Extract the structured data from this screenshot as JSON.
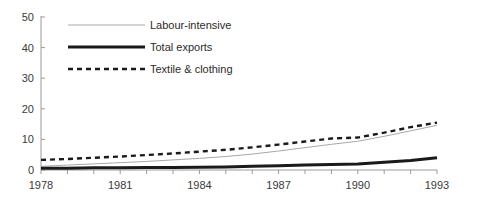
{
  "chart_data": {
    "type": "line",
    "title": "",
    "xlabel": "",
    "ylabel": "",
    "xlim": [
      1978,
      1993
    ],
    "ylim": [
      0,
      50
    ],
    "grid": false,
    "legend_position": "top-left-inside",
    "y_ticks": [
      0,
      10,
      20,
      30,
      40,
      50
    ],
    "y_tick_labels": [
      "0",
      "10",
      "20",
      "30",
      "40",
      "50"
    ],
    "x": [
      1978,
      1979,
      1980,
      1981,
      1982,
      1983,
      1984,
      1985,
      1986,
      1987,
      1988,
      1989,
      1990,
      1991,
      1992,
      1993
    ],
    "x_ticks": [
      1978,
      1979,
      1980,
      1981,
      1982,
      1983,
      1984,
      1985,
      1986,
      1987,
      1988,
      1989,
      1990,
      1991,
      1992,
      1993
    ],
    "x_tick_labels_shown": [
      "1978",
      "1981",
      "1984",
      "1987",
      "1990",
      "1993"
    ],
    "x_labeled_values": [
      1978,
      1981,
      1984,
      1987,
      1990,
      1993
    ],
    "series": [
      {
        "name": "Labour-intensive",
        "style": "thin-solid",
        "color": "#a8a8a8",
        "width": 1,
        "values": [
          1.2,
          1.6,
          2.0,
          2.4,
          2.8,
          3.3,
          3.8,
          4.4,
          5.2,
          6.2,
          7.3,
          8.4,
          9.4,
          11.0,
          12.8,
          14.6
        ]
      },
      {
        "name": "Total exports",
        "style": "thick-solid",
        "color": "#1a1a1a",
        "width": 3,
        "values": [
          0.6,
          0.6,
          0.7,
          0.7,
          0.8,
          0.8,
          0.9,
          1.0,
          1.2,
          1.4,
          1.6,
          1.8,
          2.0,
          2.5,
          3.1,
          4.0
        ]
      },
      {
        "name": "Textile & clothing",
        "style": "dashed",
        "color": "#1a1a1a",
        "width": 2.4,
        "values": [
          3.3,
          3.6,
          4.0,
          4.4,
          4.9,
          5.4,
          6.0,
          6.6,
          7.4,
          8.3,
          9.3,
          10.3,
          10.6,
          12.2,
          14.0,
          15.5
        ]
      }
    ],
    "legend": [
      {
        "label": "Labour-intensive",
        "style": "thin-solid",
        "color": "#a8a8a8"
      },
      {
        "label": "Total exports",
        "style": "thick-solid",
        "color": "#1a1a1a"
      },
      {
        "label": "Textile & clothing",
        "style": "dashed",
        "color": "#1a1a1a"
      }
    ]
  }
}
